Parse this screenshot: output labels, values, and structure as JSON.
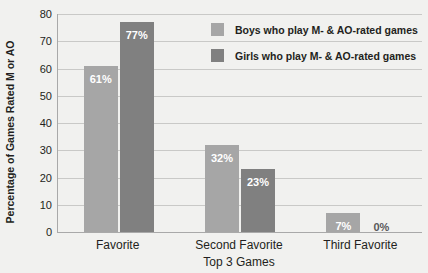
{
  "chart_data": {
    "type": "bar",
    "title": "",
    "xlabel": "Top 3 Games",
    "ylabel": "Percentage of Games Rated M or AO",
    "categories": [
      "Favorite",
      "Second Favorite",
      "Third Favorite"
    ],
    "ylim": [
      0,
      80
    ],
    "yticks": [
      0,
      10,
      20,
      30,
      40,
      50,
      60,
      70,
      80
    ],
    "ytick_labels": [
      "0",
      "10",
      "20",
      "30",
      "40",
      "50",
      "60",
      "70",
      "80"
    ],
    "grid": true,
    "legend_position": "top-right",
    "series": [
      {
        "name": "Boys who play M- & AO-rated games",
        "color": "#a6a6a6",
        "values": [
          61,
          32,
          7
        ],
        "labels": [
          "61%",
          "32%",
          "7%"
        ]
      },
      {
        "name": "Girls who play M- & AO-rated games",
        "color": "#808080",
        "values": [
          77,
          23,
          0
        ],
        "labels": [
          "77%",
          "23%",
          "0%"
        ]
      }
    ]
  },
  "colors": {
    "background": "#f1f1ef",
    "axis": "#a9a9a9",
    "gridline": "#c9c9c7",
    "text": "#231f20",
    "value_label": "#ffffff",
    "zero_label": "#58585a"
  }
}
